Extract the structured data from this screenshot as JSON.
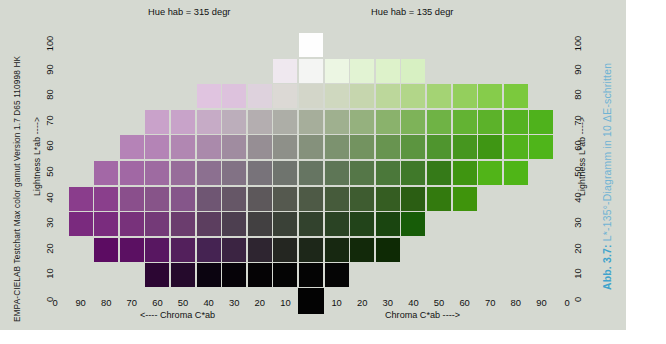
{
  "chart_data": {
    "type": "heatmap",
    "title": "EMPA-CIELAB Testchart Max color gamut Version 1.7   D65   110998 HK",
    "caption_bold": "Abb. 3.7:",
    "caption_rest": " L*-135°-Diagramm in 10 ΔE-schritten",
    "hue_left_label": "Hue   hab = 315 degr",
    "hue_right_label": "Hue   hab = 135 degr",
    "xlabel_left": "<---- Chroma C*ab",
    "xlabel_right": "Chroma C*ab ---->",
    "ylabel": "Lightness  L*ab ---->",
    "ylim": [
      0,
      100
    ],
    "ytick_labels": [
      "0",
      "10",
      "20",
      "30",
      "40",
      "50",
      "60",
      "70",
      "80",
      "90",
      "100"
    ],
    "xtick_labels": [
      "0",
      "90",
      "80",
      "70",
      "60",
      "50",
      "40",
      "30",
      "20",
      "10",
      "",
      "10",
      "20",
      "30",
      "40",
      "50",
      "60",
      "70",
      "80",
      "90",
      "0"
    ],
    "grid": true,
    "legend": "none",
    "hue_left_deg": 315,
    "hue_right_deg": 135,
    "delta_e_step": 10,
    "rows": [
      {
        "L": 100,
        "cells": [
          {
            "c": 0,
            "hex": "#fefefe"
          }
        ]
      },
      {
        "L": 90,
        "cells": [
          {
            "c": -10,
            "hex": "#efe8ef"
          },
          {
            "c": 0,
            "hex": "#f4f5f3"
          },
          {
            "c": 10,
            "hex": "#ecf6e3"
          },
          {
            "c": 20,
            "hex": "#e2f3d3"
          },
          {
            "c": 30,
            "hex": "#ddf2ca"
          },
          {
            "c": 40,
            "hex": "#d7f0c2"
          }
        ]
      },
      {
        "L": 80,
        "cells": [
          {
            "c": -40,
            "hex": "#e0c4e0"
          },
          {
            "c": -30,
            "hex": "#ddc2dd"
          },
          {
            "c": -20,
            "hex": "#ded2dd"
          },
          {
            "c": -10,
            "hex": "#dcd9d5"
          },
          {
            "c": 0,
            "hex": "#d3d6c9"
          },
          {
            "c": 10,
            "hex": "#cfd8bf"
          },
          {
            "c": 20,
            "hex": "#c6d6ae"
          },
          {
            "c": 30,
            "hex": "#bcd79b"
          },
          {
            "c": 40,
            "hex": "#b2d689"
          },
          {
            "c": 50,
            "hex": "#a4d374"
          },
          {
            "c": 60,
            "hex": "#94cf5d"
          },
          {
            "c": 70,
            "hex": "#86cc4b"
          },
          {
            "c": 80,
            "hex": "#7bc93d"
          }
        ]
      },
      {
        "L": 70,
        "cells": [
          {
            "c": -60,
            "hex": "#c9a2ca"
          },
          {
            "c": -50,
            "hex": "#c8a3c9"
          },
          {
            "c": -40,
            "hex": "#c6abc6"
          },
          {
            "c": -30,
            "hex": "#bcaebb"
          },
          {
            "c": -20,
            "hex": "#b4aeb0"
          },
          {
            "c": -10,
            "hex": "#adaea7"
          },
          {
            "c": 0,
            "hex": "#a6ae9b"
          },
          {
            "c": 10,
            "hex": "#9fb08f"
          },
          {
            "c": 20,
            "hex": "#95b17e"
          },
          {
            "c": 30,
            "hex": "#8ab26c"
          },
          {
            "c": 40,
            "hex": "#7eb359"
          },
          {
            "c": 50,
            "hex": "#6fb345"
          },
          {
            "c": 60,
            "hex": "#63b333"
          },
          {
            "c": 70,
            "hex": "#5cb22a"
          },
          {
            "c": 80,
            "hex": "#55b222"
          },
          {
            "c": 90,
            "hex": "#4fb21c"
          }
        ]
      },
      {
        "L": 60,
        "cells": [
          {
            "c": -70,
            "hex": "#b583b7"
          },
          {
            "c": -60,
            "hex": "#b484b6"
          },
          {
            "c": -50,
            "hex": "#b187b2"
          },
          {
            "c": -40,
            "hex": "#aa8aab"
          },
          {
            "c": -30,
            "hex": "#a08ca0"
          },
          {
            "c": -20,
            "hex": "#968e94"
          },
          {
            "c": -10,
            "hex": "#8e9089"
          },
          {
            "c": 0,
            "hex": "#85917c"
          },
          {
            "c": 10,
            "hex": "#7c926f"
          },
          {
            "c": 20,
            "hex": "#739360"
          },
          {
            "c": 30,
            "hex": "#689450"
          },
          {
            "c": 40,
            "hex": "#5c9540"
          },
          {
            "c": 50,
            "hex": "#4f952e"
          },
          {
            "c": 60,
            "hex": "#46961f"
          },
          {
            "c": 70,
            "hex": "#3f9614"
          },
          {
            "c": 80,
            "hex": "#52b31c"
          },
          {
            "c": 90,
            "hex": "#4fb51a"
          }
        ]
      },
      {
        "L": 50,
        "cells": [
          {
            "c": -80,
            "hex": "#a368a6"
          },
          {
            "c": -70,
            "hex": "#a168a4"
          },
          {
            "c": -60,
            "hex": "#9e6ba1"
          },
          {
            "c": -50,
            "hex": "#976d9a"
          },
          {
            "c": -40,
            "hex": "#8c7090"
          },
          {
            "c": -30,
            "hex": "#827285"
          },
          {
            "c": -20,
            "hex": "#78737a"
          },
          {
            "c": -10,
            "hex": "#6f746e"
          },
          {
            "c": 0,
            "hex": "#667562"
          },
          {
            "c": 10,
            "hex": "#5e7656"
          },
          {
            "c": 20,
            "hex": "#557748"
          },
          {
            "c": 30,
            "hex": "#4b783a"
          },
          {
            "c": 40,
            "hex": "#40792a"
          },
          {
            "c": 50,
            "hex": "#357a18"
          },
          {
            "c": 60,
            "hex": "#3f9511"
          },
          {
            "c": 70,
            "hex": "#51b418"
          },
          {
            "c": 80,
            "hex": "#4fb517"
          }
        ]
      },
      {
        "L": 40,
        "cells": [
          {
            "c": -90,
            "hex": "#8a3d8c"
          },
          {
            "c": -80,
            "hex": "#8a3f8c"
          },
          {
            "c": -70,
            "hex": "#8a4f8c"
          },
          {
            "c": -60,
            "hex": "#875489"
          },
          {
            "c": -50,
            "hex": "#85568a"
          },
          {
            "c": -40,
            "hex": "#6f5673"
          },
          {
            "c": -30,
            "hex": "#665767"
          },
          {
            "c": -20,
            "hex": "#5d585b"
          },
          {
            "c": -10,
            "hex": "#55594f"
          },
          {
            "c": 0,
            "hex": "#4e5a46"
          },
          {
            "c": 10,
            "hex": "#465b3b"
          },
          {
            "c": 20,
            "hex": "#3e5c30"
          },
          {
            "c": 30,
            "hex": "#355d22"
          },
          {
            "c": 40,
            "hex": "#2b5e13"
          },
          {
            "c": 50,
            "hex": "#337a0e"
          },
          {
            "c": 60,
            "hex": "#3f940c"
          }
        ]
      },
      {
        "L": 30,
        "cells": [
          {
            "c": -90,
            "hex": "#7a2a7e"
          },
          {
            "c": -80,
            "hex": "#7a2c7e"
          },
          {
            "c": -70,
            "hex": "#78327b"
          },
          {
            "c": -60,
            "hex": "#743a78"
          },
          {
            "c": -50,
            "hex": "#6b3d6e"
          },
          {
            "c": -40,
            "hex": "#5c3e5f"
          },
          {
            "c": -30,
            "hex": "#4d3f50"
          },
          {
            "c": -20,
            "hex": "#424041"
          },
          {
            "c": -10,
            "hex": "#3a4137"
          },
          {
            "c": 0,
            "hex": "#32422d"
          },
          {
            "c": 10,
            "hex": "#2a4324"
          },
          {
            "c": 20,
            "hex": "#22441a"
          },
          {
            "c": 30,
            "hex": "#1a4510"
          },
          {
            "c": 40,
            "hex": "#175c08"
          }
        ]
      },
      {
        "L": 20,
        "cells": [
          {
            "c": -80,
            "hex": "#5c0c62"
          },
          {
            "c": -70,
            "hex": "#5b1062"
          },
          {
            "c": -60,
            "hex": "#581761"
          },
          {
            "c": -50,
            "hex": "#53205c"
          },
          {
            "c": -40,
            "hex": "#452352"
          },
          {
            "c": -30,
            "hex": "#3b2442"
          },
          {
            "c": -20,
            "hex": "#2e2530"
          },
          {
            "c": -10,
            "hex": "#242621"
          },
          {
            "c": 0,
            "hex": "#1d2719"
          },
          {
            "c": 10,
            "hex": "#172811"
          },
          {
            "c": 20,
            "hex": "#12290a"
          },
          {
            "c": 30,
            "hex": "#0e2a05"
          }
        ]
      },
      {
        "L": 10,
        "cells": [
          {
            "c": -60,
            "hex": "#2c0633"
          },
          {
            "c": -50,
            "hex": "#250a2c"
          },
          {
            "c": -40,
            "hex": "#0b0410"
          },
          {
            "c": -30,
            "hex": "#060308"
          },
          {
            "c": -20,
            "hex": "#050305"
          },
          {
            "c": -10,
            "hex": "#040404"
          },
          {
            "c": 0,
            "hex": "#040404"
          },
          {
            "c": 10,
            "hex": "#050505"
          }
        ]
      },
      {
        "L": 0,
        "cells": [
          {
            "c": 0,
            "hex": "#030303"
          }
        ]
      }
    ]
  }
}
